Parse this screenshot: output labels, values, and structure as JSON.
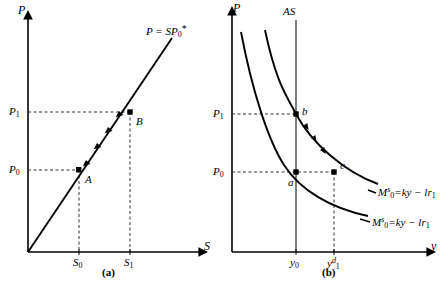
{
  "figure": {
    "panels": [
      {
        "caption": "(a)",
        "y_axis_label": "P",
        "x_axis_label": "S",
        "curve_label_parts": {
          "lhs": "P",
          "eq": "=",
          "rhs_main": "SP",
          "rhs_sub": "0",
          "rhs_star": "*"
        },
        "curve_label_text": "P = SP0*",
        "y_ticks": [
          {
            "label_main": "P",
            "label_sub": "1",
            "text": "P1"
          },
          {
            "label_main": "P",
            "label_sub": "0",
            "text": "P0"
          }
        ],
        "x_ticks": [
          {
            "label_main": "S",
            "label_sub": "0",
            "text": "S0"
          },
          {
            "label_main": "S",
            "label_sub": "1",
            "text": "S1"
          }
        ],
        "points": [
          {
            "label": "A"
          },
          {
            "label": "B"
          }
        ]
      },
      {
        "caption": "(b)",
        "y_axis_label": "P",
        "x_axis_label": "y",
        "vertical_line_label": "AS",
        "y_ticks": [
          {
            "label_main": "P",
            "label_sub": "1",
            "text": "P1"
          },
          {
            "label_main": "P",
            "label_sub": "0",
            "text": "P0"
          }
        ],
        "x_ticks": [
          {
            "label_main": "y",
            "label_sub": "0",
            "label_sup": "",
            "text": "y0"
          },
          {
            "label_main": "y",
            "label_sub": "1",
            "label_sup": "d",
            "text": "y1d"
          }
        ],
        "points": [
          {
            "label": "a"
          },
          {
            "label": "b"
          },
          {
            "label": "c"
          }
        ],
        "curve_labels": [
          {
            "m": "M",
            "m_sub": "0",
            "m_sup": "s",
            "eq": "=",
            "rhs": "ky − lr",
            "rhs_sub": "1",
            "text": "M0s = ky - lr1"
          },
          {
            "m": "M",
            "m_sub": "0",
            "m_sup": "s",
            "eq": "=",
            "rhs": "ky − lr",
            "rhs_sub": "1",
            "text": "M0s = ky - lr1"
          }
        ]
      }
    ],
    "colors": {
      "line": "#000000",
      "axis": "#000000",
      "dashed": "#333333",
      "as_line": "#555555",
      "background": "#ffffff"
    }
  }
}
